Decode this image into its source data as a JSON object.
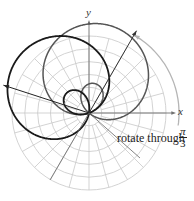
{
  "figure": {
    "axes": {
      "x_label": "x",
      "y_label": "y"
    },
    "annotation": {
      "text": "rotate through",
      "fraction_num": "π",
      "fraction_den": "3"
    },
    "colors": {
      "grid": "#c8c8c8",
      "axis": "#707070",
      "original_curve": "#555555",
      "rotated_curve": "#1a1a1a",
      "rotation_arc": "#b5b5b5"
    },
    "grid": {
      "rings": 6,
      "spokes_deg": 15
    },
    "rotation_angle_rad": "π/3"
  }
}
